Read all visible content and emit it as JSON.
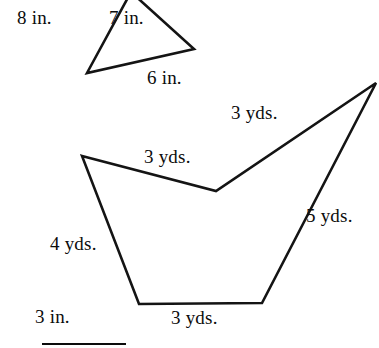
{
  "page": {
    "background_color": "#ffffff",
    "ink_color": "#0c0c0c",
    "width": 379,
    "height": 348
  },
  "figures": [
    {
      "name": "triangle-inches",
      "shape": "triangle",
      "unit": "in.",
      "stroke_color": "#141414",
      "stroke_width": 2.6,
      "vertices": [
        {
          "name": "apex-top",
          "x": 131,
          "y": -8
        },
        {
          "name": "bottom-left",
          "x": 87,
          "y": 73
        },
        {
          "name": "right",
          "x": 194,
          "y": 49
        }
      ],
      "side_labels": [
        {
          "name": "label-8-in",
          "text": "8 in.",
          "x": 17,
          "y": 8
        },
        {
          "name": "label-7-in",
          "text": "7 in.",
          "x": 109,
          "y": 8
        },
        {
          "name": "label-6-in",
          "text": "6 in.",
          "x": 147,
          "y": 68
        }
      ]
    },
    {
      "name": "quadrilateral-yards",
      "shape": "concave-pentagon",
      "unit": "yds.",
      "stroke_color": "#141414",
      "stroke_width": 2.6,
      "vertices": [
        {
          "name": "upper-left",
          "x": 82,
          "y": 156
        },
        {
          "name": "valley",
          "x": 216,
          "y": 191
        },
        {
          "name": "peak-right",
          "x": 376,
          "y": 83
        },
        {
          "name": "bottom-right",
          "x": 262,
          "y": 303
        },
        {
          "name": "bottom-left",
          "x": 139,
          "y": 304
        }
      ],
      "side_labels": [
        {
          "name": "label-3-yds-upper-right",
          "text": "3 yds.",
          "x": 231,
          "y": 103
        },
        {
          "name": "label-3-yds-upper-left",
          "text": "3 yds.",
          "x": 144,
          "y": 147
        },
        {
          "name": "label-5-yds-right",
          "text": "5 yds.",
          "x": 306,
          "y": 206
        },
        {
          "name": "label-4-yds-left",
          "text": "4 yds.",
          "x": 50,
          "y": 234
        },
        {
          "name": "label-3-yds-bottom",
          "text": "3 yds.",
          "x": 171,
          "y": 308
        }
      ]
    }
  ],
  "footer": {
    "name": "answer-blank",
    "label": "3 in.",
    "label_x": 35,
    "label_y": 307,
    "rule": {
      "x": 42,
      "y": 343,
      "width": 84,
      "height": 2
    }
  }
}
